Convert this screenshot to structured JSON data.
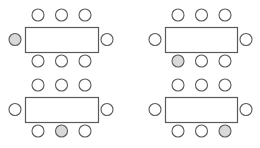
{
  "diagram": {
    "title": "",
    "colors": {
      "background": "#ffffff",
      "stroke": "#5a5a5a",
      "chair_empty": "#ffffff",
      "chair_highlight": "#d9d9d9"
    },
    "tables": [
      {
        "id": "top-left",
        "x": 25,
        "y": 27,
        "w": 73,
        "h": 25,
        "highlight": "left"
      },
      {
        "id": "top-right",
        "x": 165,
        "y": 27,
        "w": 72,
        "h": 25,
        "highlight": "bottom-1"
      },
      {
        "id": "bottom-left",
        "x": 25,
        "y": 97,
        "w": 73,
        "h": 25,
        "highlight": "bottom-2"
      },
      {
        "id": "bottom-right",
        "x": 165,
        "y": 97,
        "w": 72,
        "h": 25,
        "highlight": "bottom-3"
      }
    ],
    "chair_radius": 6
  }
}
